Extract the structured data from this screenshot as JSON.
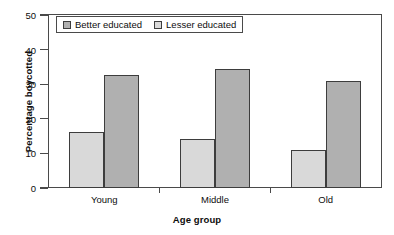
{
  "chart_data": {
    "type": "bar",
    "title": "",
    "subtitle": "",
    "xlabel": "Age group",
    "ylabel": "Percentage boycotted",
    "categories": [
      "Young",
      "Middle",
      "Old"
    ],
    "series": [
      {
        "name": "Better educated",
        "color": "#b0b0b0",
        "values": [
          32.7,
          34.3,
          31.0
        ]
      },
      {
        "name": "Lesser educated",
        "color": "#d9d9d9",
        "values": [
          16.3,
          14.2,
          11.1
        ]
      }
    ],
    "ylim": [
      0,
      50
    ],
    "yticks": [
      0,
      10,
      20,
      30,
      40,
      50
    ],
    "ytick_labels": [
      "0",
      "10",
      "20",
      "30",
      "40",
      "50"
    ],
    "grid": false,
    "legend_position": "top-left-inside",
    "bar_order_in_group": [
      "Lesser educated",
      "Better educated"
    ],
    "frame_color": "#4a4a4a",
    "bar_edge_color": "#3d3d3d",
    "text_color": "#0d0d0d"
  },
  "legend": {
    "entries": [
      {
        "label": "Better educated",
        "swatch_color": "#b0b0b0"
      },
      {
        "label": "Lesser educated",
        "swatch_color": "#d9d9d9"
      }
    ]
  },
  "axes": {
    "y_title": "Percentage boycotted",
    "x_title": "Age group",
    "y_labels": [
      "50",
      "40",
      "30",
      "20",
      "10",
      "0"
    ],
    "x_labels": [
      "Young",
      "Middle",
      "Old"
    ]
  }
}
